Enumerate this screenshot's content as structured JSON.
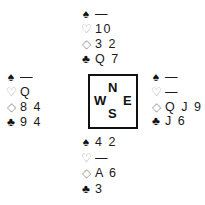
{
  "hands": {
    "north": {
      "spades": "—",
      "hearts": "10",
      "diamonds": "3 2",
      "clubs": "Q 7"
    },
    "west": {
      "spades": "—",
      "hearts": "Q",
      "diamonds": "8 4",
      "clubs": "9 4"
    },
    "east": {
      "spades": "—",
      "hearts": "—",
      "diamonds": "Q J 9",
      "clubs": "J 6"
    },
    "south": {
      "spades": "4 2",
      "hearts": "—",
      "diamonds": "A 6",
      "clubs": "3"
    }
  },
  "suit_symbols": {
    "spades": "♠",
    "hearts": "♡",
    "diamonds": "◇",
    "clubs": "♣"
  },
  "compass": {
    "north": "N",
    "south": "S",
    "east": "E",
    "west": "W"
  }
}
